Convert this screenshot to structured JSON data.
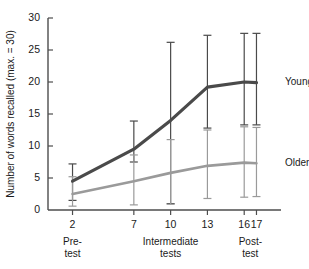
{
  "chart_data": {
    "type": "line",
    "title": "",
    "xlabel": "",
    "ylabel": "Number of words recalled (max. = 30)",
    "ylim": [
      0,
      30
    ],
    "xlim": [
      0,
      19
    ],
    "grid": false,
    "legend_position": "right-inline",
    "y_ticks": [
      0,
      5,
      10,
      15,
      20,
      25,
      30
    ],
    "y_tick_labels": [
      "0",
      "5",
      "10",
      "15",
      "20",
      "25",
      "30"
    ],
    "x_ticks": [
      2,
      7,
      10,
      13,
      16,
      17
    ],
    "x_tick_labels": [
      "2",
      "7",
      "10",
      "13",
      "16",
      "17"
    ],
    "x_group_labels": [
      {
        "text_line1": "Pre-",
        "text_line2": "test",
        "at_x": 2
      },
      {
        "text_line1": "Intermediate",
        "text_line2": "tests",
        "at_x": 10
      },
      {
        "text_line1": "Post-",
        "text_line2": "test",
        "at_x": 16.5
      }
    ],
    "series": [
      {
        "name": "Young adults",
        "color": "#4a4a4a",
        "x": [
          2,
          7,
          10,
          13,
          16,
          17
        ],
        "values": [
          4.5,
          9.5,
          14.0,
          19.2,
          20.0,
          19.9
        ],
        "error_low": [
          1.5,
          7.5,
          1.0,
          12.8,
          13.3,
          13.3
        ],
        "error_high": [
          7.2,
          13.9,
          26.2,
          27.3,
          27.6,
          27.6
        ]
      },
      {
        "name": "Older adults",
        "color": "#9a9a9a",
        "x": [
          2,
          7,
          10,
          13,
          16,
          17
        ],
        "values": [
          2.5,
          4.5,
          5.8,
          6.9,
          7.4,
          7.3
        ],
        "error_low": [
          0.6,
          0.8,
          0.9,
          1.8,
          2.0,
          2.1
        ],
        "error_high": [
          5.2,
          8.6,
          11.0,
          12.5,
          13.0,
          12.9
        ]
      }
    ]
  }
}
